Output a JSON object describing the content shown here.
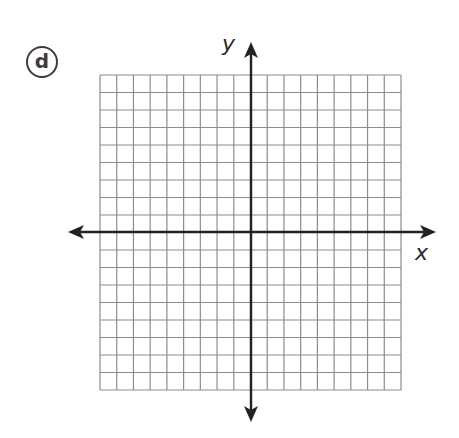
{
  "problem": {
    "label": "d"
  },
  "axes": {
    "x_label": "x",
    "y_label": "y"
  },
  "grid": {
    "columns": 18,
    "rows": 18,
    "left": 100,
    "top": 75,
    "right": 401,
    "bottom": 390,
    "origin_col": 9,
    "origin_row": 9,
    "grid_color": "#8c8c8c",
    "axis_color": "#222222"
  },
  "chart_data": {
    "type": "scatter",
    "title": "",
    "xlabel": "x",
    "ylabel": "y",
    "xlim": [
      -9,
      9
    ],
    "ylim": [
      -9,
      9
    ],
    "grid": true,
    "series": [],
    "annotations": [
      "d"
    ]
  }
}
